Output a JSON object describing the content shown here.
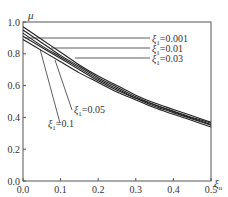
{
  "chart_data": {
    "type": "line",
    "title": "",
    "xlabel": "ξu",
    "ylabel": "μ",
    "xlim": [
      0.0,
      0.5
    ],
    "ylim": [
      0.0,
      1.0
    ],
    "grid": false,
    "legend_position": "inline labels with leader lines",
    "x_ticks": [
      "0.0",
      "0.1",
      "0.2",
      "0.3",
      "0.4",
      "0.5"
    ],
    "y_ticks": [
      "0.0",
      "0.2",
      "0.4",
      "0.6",
      "0.8",
      "1.0"
    ],
    "x": [
      0.0,
      0.05,
      0.1,
      0.15,
      0.2,
      0.25,
      0.3,
      0.35,
      0.4,
      0.45,
      0.5
    ],
    "series": [
      {
        "name": "ξ1=0.001",
        "label_main": "ξ",
        "label_sub": "1",
        "label_value": "=0.001",
        "values": [
          0.97,
          0.89,
          0.81,
          0.73,
          0.66,
          0.6,
          0.54,
          0.49,
          0.45,
          0.41,
          0.37
        ]
      },
      {
        "name": "ξ1=0.01",
        "label_main": "ξ",
        "label_sub": "1",
        "label_value": "=0.01",
        "values": [
          0.95,
          0.87,
          0.79,
          0.72,
          0.65,
          0.59,
          0.53,
          0.48,
          0.44,
          0.4,
          0.365
        ]
      },
      {
        "name": "ξ1=0.03",
        "label_main": "ξ",
        "label_sub": "1",
        "label_value": "=0.03",
        "values": [
          0.93,
          0.85,
          0.78,
          0.71,
          0.64,
          0.58,
          0.52,
          0.48,
          0.435,
          0.395,
          0.355
        ]
      },
      {
        "name": "ξ1=0.05",
        "label_main": "ξ",
        "label_sub": "1",
        "label_value": "=0.05",
        "values": [
          0.91,
          0.84,
          0.77,
          0.7,
          0.63,
          0.57,
          0.52,
          0.47,
          0.43,
          0.39,
          0.35
        ]
      },
      {
        "name": "ξ1=0.1",
        "label_main": "ξ",
        "label_sub": "1",
        "label_value": "=0.1",
        "values": [
          0.89,
          0.82,
          0.75,
          0.68,
          0.62,
          0.56,
          0.51,
          0.46,
          0.42,
          0.38,
          0.34
        ]
      }
    ]
  }
}
